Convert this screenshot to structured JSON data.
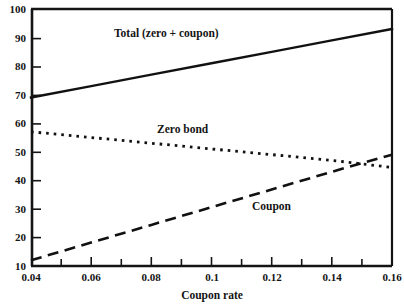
{
  "chart_data": {
    "type": "line",
    "title": "",
    "xlabel": "Coupon rate",
    "ylabel": "",
    "xlim": [
      0.04,
      0.16
    ],
    "ylim": [
      10,
      100
    ],
    "grid": false,
    "legend_position": "inline-annotations",
    "xticks": [
      "0.04",
      "0.06",
      "0.08",
      "0.1",
      "0.12",
      "0.14",
      "0.16"
    ],
    "xtick_values": [
      0.04,
      0.06,
      0.08,
      0.1,
      0.12,
      0.14,
      0.16
    ],
    "xminor_ticks": [
      0.05,
      0.07,
      0.09,
      0.11,
      0.13,
      0.15
    ],
    "yticks": [
      "10",
      "20",
      "30",
      "40",
      "50",
      "60",
      "70",
      "80",
      "90",
      "100"
    ],
    "ytick_values": [
      10,
      20,
      30,
      40,
      50,
      60,
      70,
      80,
      90,
      100
    ],
    "x": [
      0.04,
      0.06,
      0.08,
      0.1,
      0.12,
      0.14,
      0.16
    ],
    "series": [
      {
        "name": "Total (zero + coupon)",
        "style": "solid",
        "color": "#111111",
        "values": [
          69.0,
          73.0,
          77.0,
          81.0,
          85.0,
          89.0,
          93.0
        ]
      },
      {
        "name": "Zero bond",
        "style": "dotted",
        "color": "#111111",
        "values": [
          57.0,
          55.0,
          53.0,
          51.0,
          49.0,
          47.0,
          44.5
        ]
      },
      {
        "name": "Coupon",
        "style": "dashed",
        "color": "#111111",
        "values": [
          12.0,
          18.2,
          24.4,
          30.6,
          36.8,
          43.0,
          49.0
        ]
      }
    ],
    "annotations": [
      {
        "text": "Total (zero + coupon)",
        "x": 0.081,
        "y": 88.5
      },
      {
        "text": "Zero bond",
        "x": 0.092,
        "y": 57.0
      },
      {
        "text": "Coupon",
        "x": 0.118,
        "y": 30.5
      }
    ]
  }
}
